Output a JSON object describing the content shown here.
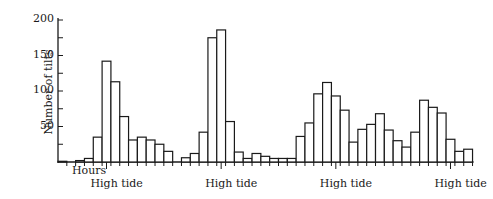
{
  "chart_data": {
    "type": "bar",
    "title": "",
    "xlabel": "Hours",
    "ylabel": "Number of tilts",
    "ylim": [
      0,
      200
    ],
    "yticks": [
      50,
      100,
      150,
      200
    ],
    "grid": false,
    "legend": null,
    "bar_style": "histogram, outline only, contiguous bars",
    "bin_unit": "hour",
    "values": [
      1,
      0,
      2,
      5,
      35,
      142,
      113,
      64,
      31,
      35,
      31,
      25,
      15,
      0,
      6,
      12,
      42,
      175,
      186,
      57,
      14,
      5,
      12,
      8,
      5,
      5,
      5,
      36,
      55,
      96,
      112,
      93,
      73,
      28,
      46,
      53,
      68,
      45,
      30,
      21,
      42,
      87,
      77,
      69,
      32,
      15,
      18
    ],
    "annotations": [
      {
        "text": "High tide",
        "bin_index": 5.5
      },
      {
        "text": "High tide",
        "bin_index": 18.5
      },
      {
        "text": "High tide",
        "bin_index": 31.5
      },
      {
        "text": "High tide",
        "bin_index": 44.5
      }
    ]
  },
  "labels": {
    "ylabel": "Number of tilts",
    "xlabel": "Hours",
    "annotation": "High tide",
    "ytick_labels": [
      "200",
      "150",
      "100",
      "50"
    ]
  }
}
